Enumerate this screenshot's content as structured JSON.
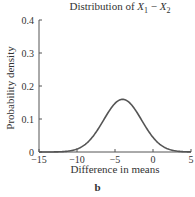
{
  "chart_data": {
    "type": "line",
    "xlabel": "Difference in means",
    "ylabel": "Probability density",
    "panel_label": "b",
    "xlim": [
      -15,
      5
    ],
    "ylim": [
      0,
      0.4
    ],
    "xticks": [
      -15,
      -10,
      -5,
      0,
      5
    ],
    "yticks": [
      0,
      0.1,
      0.2,
      0.3,
      0.4
    ],
    "ytick_labels": [
      "0",
      "0.1",
      "0.2",
      "0.3",
      "0.4"
    ],
    "grid": false,
    "legend": null,
    "series": [
      {
        "name": "Normal density",
        "distribution": {
          "type": "normal",
          "mean": -4,
          "sd": 2.5
        },
        "x": [
          -15,
          -14,
          -13,
          -12,
          -11,
          -10,
          -9,
          -8,
          -7,
          -6,
          -5,
          -4,
          -3,
          -2,
          -1,
          0,
          1,
          2,
          3,
          4,
          5
        ],
        "values": [
          0.0,
          0.0006,
          0.0024,
          0.0095,
          0.0033,
          0.0089,
          0.0216,
          0.0444,
          0.0777,
          0.1158,
          0.1473,
          0.1596,
          0.1473,
          0.1158,
          0.0777,
          0.0444,
          0.0216,
          0.0089,
          0.0033,
          0.001,
          0.0002
        ]
      }
    ]
  }
}
